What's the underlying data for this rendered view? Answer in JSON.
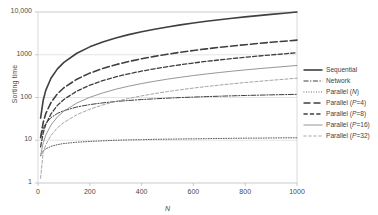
{
  "chart_data": {
    "type": "line",
    "title": "",
    "xlabel": "N",
    "ylabel": "Sorting time",
    "yscale": "log",
    "xlim": [
      0,
      1000
    ],
    "ylim": [
      1,
      10000
    ],
    "grid": "horizontal",
    "legend_position": "right",
    "x_ticks": [
      "0",
      "200",
      "400",
      "600",
      "800",
      "1000"
    ],
    "x_tick_values": [
      0,
      200,
      400,
      600,
      800,
      1000
    ],
    "y_ticks": [
      "1",
      "10",
      "100",
      "1000",
      "10,000"
    ],
    "y_tick_values": [
      1,
      10,
      100,
      1000,
      10000
    ],
    "x": [
      10,
      20,
      30,
      50,
      75,
      100,
      150,
      200,
      250,
      300,
      350,
      400,
      450,
      500,
      550,
      600,
      650,
      700,
      750,
      800,
      850,
      900,
      950,
      1000
    ],
    "series": [
      {
        "name": "Sequential",
        "label": "Sequential",
        "style": "solid",
        "width": 1.6,
        "color": "#3f3f3f",
        "values": [
          33,
          86,
          147,
          282,
          467,
          664,
          1084,
          1529,
          1991,
          2468,
          2955,
          3453,
          3959,
          4472,
          4993,
          5519,
          6051,
          6588,
          7130,
          7677,
          8228,
          8783,
          9341,
          9966
        ]
      },
      {
        "name": "Network",
        "label": "Network",
        "style": "dashdot",
        "width": 1.0,
        "color": "#3f3f3f",
        "values": [
          11.6,
          18.7,
          24.5,
          33.8,
          42.4,
          49.3,
          60.0,
          68.3,
          74.9,
          80.5,
          85.3,
          89.5,
          93.2,
          96.5,
          99.6,
          102.3,
          104.9,
          107.2,
          109.4,
          111.5,
          113.4,
          115.2,
          116.9,
          118.5
        ]
      },
      {
        "name": "Parallel (N)",
        "label": "Parallel (<i>N</i>)",
        "style": "dotted",
        "width": 1.0,
        "color": "#5a5a5a",
        "values": [
          4.3,
          5.6,
          6.3,
          7.2,
          7.9,
          8.4,
          9.0,
          9.4,
          9.7,
          10.0,
          10.2,
          10.3,
          10.5,
          10.6,
          10.7,
          10.8,
          10.9,
          11.0,
          11.1,
          11.2,
          11.2,
          11.3,
          11.4,
          11.4
        ]
      },
      {
        "name": "Parallel (P=4)",
        "label": "Parallel (<i>P</i>=4)",
        "style": "longdash",
        "width": 1.6,
        "color": "#3f3f3f",
        "values": [
          11.5,
          26.0,
          42.0,
          76.0,
          122,
          169,
          268,
          372,
          478,
          586,
          696,
          806,
          918,
          1031,
          1144,
          1258,
          1373,
          1488,
          1604,
          1720,
          1837,
          1954,
          2072,
          2200
        ]
      },
      {
        "name": "Parallel (P=8)",
        "label": "Parallel (<i>P</i>=8)",
        "style": "dash",
        "width": 1.3,
        "color": "#3f3f3f",
        "values": [
          7.0,
          14.8,
          23.3,
          41.3,
          65.4,
          90.0,
          141,
          194,
          248,
          303,
          358,
          414,
          470,
          527,
          584,
          642,
          699,
          757,
          815,
          874,
          932,
          991,
          1050,
          1115
        ]
      },
      {
        "name": "Parallel (P=16)",
        "label": "Parallel (<i>P</i>=16)",
        "style": "solid",
        "width": 0.9,
        "color": "#8a8a8a",
        "values": [
          4.4,
          8.7,
          13.2,
          22.6,
          35.2,
          48.0,
          74.3,
          101,
          128,
          156,
          184,
          212,
          240,
          269,
          297,
          326,
          355,
          384,
          413,
          442,
          471,
          500,
          530,
          562
        ]
      },
      {
        "name": "Parallel (P=32)",
        "label": "Parallel (<i>P</i>=32)",
        "style": "smalldash",
        "width": 0.9,
        "color": "#9a9a9a",
        "values": [
          1.3,
          5.2,
          7.8,
          12.9,
          19.5,
          26.1,
          39.6,
          53.3,
          67.1,
          81.1,
          95.1,
          109.2,
          123.4,
          137.6,
          151.9,
          166.2,
          180.5,
          194.9,
          209.3,
          223.8,
          238.2,
          252.7,
          267.3,
          283.0
        ]
      }
    ]
  }
}
